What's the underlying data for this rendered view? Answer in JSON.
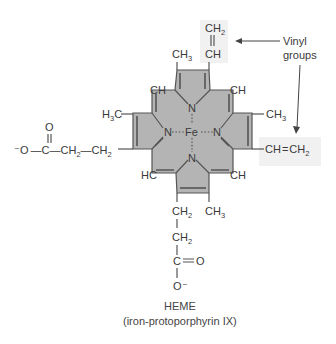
{
  "molecule": {
    "name": "HEME",
    "subtitle": "(iron-protoporphyrin IX)",
    "metal": "Fe",
    "nitrogens": [
      "N",
      "N",
      "N",
      "N"
    ],
    "meso_carbons": [
      "CH",
      "CH",
      "HC",
      "CH"
    ]
  },
  "substituents": {
    "top_left_methyl": "CH3",
    "top_vinyl_ch2": "CH2",
    "top_vinyl_ch": "CH",
    "left_methyl": "H3C",
    "right_methyl": "CH3",
    "right_vinyl": "CH=CH2",
    "bottom_right_methyl": "CH3",
    "left_propionate": "⁻O—C—CH2—CH2",
    "left_propionate_carbonyl_o": "O",
    "bottom_propionate_ch2_1": "CH2",
    "bottom_propionate_ch2_2": "CH2",
    "bottom_propionate_c": "C",
    "bottom_propionate_o_double": "O",
    "bottom_propionate_o_minus": "O⁻"
  },
  "annotation": {
    "label_line1": "Vinyl",
    "label_line2": "groups"
  },
  "colors": {
    "ring_fill": "#b4b4b4",
    "highlight_box": "#f1f1f1",
    "ink": "#3a3a3a"
  }
}
